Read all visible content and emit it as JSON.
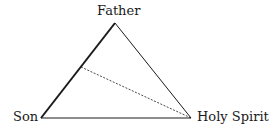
{
  "diagram": {
    "type": "triangle",
    "vertices": {
      "father": {
        "label": "Father",
        "x": 115,
        "y": 23
      },
      "son": {
        "label": "Son",
        "x": 41,
        "y": 118
      },
      "holy_spirit": {
        "label": "Holy Spirit",
        "x": 191,
        "y": 118
      }
    },
    "edges": [
      {
        "from": "son",
        "to": "father",
        "style": "thick solid"
      },
      {
        "from": "father",
        "to": "holy_spirit",
        "style": "thin solid"
      },
      {
        "from": "son",
        "to": "holy_spirit",
        "style": "thin solid"
      },
      {
        "from": "son-father midpoint",
        "to": "holy_spirit",
        "style": "dashed"
      }
    ],
    "colors": {
      "line": "#1a1a1a",
      "background": "#ffffff"
    }
  }
}
